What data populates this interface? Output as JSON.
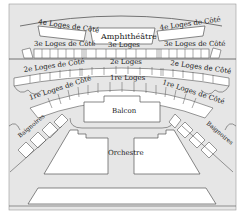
{
  "diagram": {
    "colors": {
      "background": "#e6e6e6",
      "box": "#ffffff",
      "stroke": "#555555",
      "text": "#222222"
    },
    "labels": {
      "amphitheatre": "Amphithéâtre",
      "loges4_left": "4e Loges de Côté",
      "loges4_right": "4e Loges de Côté",
      "loges3_left": "3e Loges de Côté",
      "loges3_center": "3e Loges",
      "loges3_right": "3e Loges de Côté",
      "loges2_left": "2e Loges de Côté",
      "loges2_center": "2e Loges",
      "loges2_right": "2e Loges de Côté",
      "loges1_left": "1re Loges de Côté",
      "loges1_center": "1re Loges",
      "loges1_right": "1re Loges de Côté",
      "balcon": "Balcon",
      "baignoires_left": "Baignoires",
      "baignoires_right": "Baignoires",
      "orchestre": "Orchestre"
    }
  }
}
